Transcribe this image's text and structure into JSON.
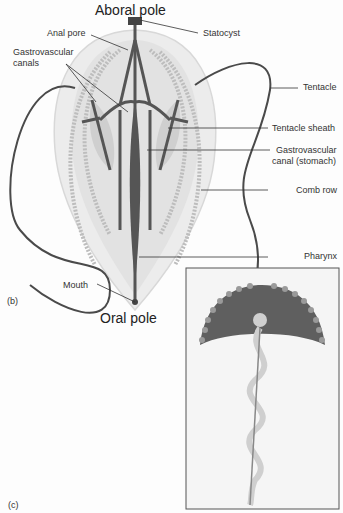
{
  "figure": {
    "title_top": "Aboral pole",
    "title_bottom": "Oral pole",
    "panel_b": "(b)",
    "panel_c": "(c)"
  },
  "labels": {
    "anal_pore": "Anal pore",
    "gv_canals_1": "Gastrovascular",
    "gv_canals_2": "canals",
    "statocyst": "Statocyst",
    "tentacle": "Tentacle",
    "tentacle_sheath": "Tentacle sheath",
    "gv_stomach_1": "Gastrovascular",
    "gv_stomach_2": "canal (stomach)",
    "comb_row": "Comb row",
    "pharynx": "Pharynx",
    "mouth": "Mouth"
  },
  "colors": {
    "body": "#e4e4e4",
    "canal": "#555555",
    "comb": "#bdbdbd",
    "tentacle": "#4a4a4a",
    "inset_bell": "#5f5f5f",
    "inset_bead": "#9a9a9a"
  }
}
